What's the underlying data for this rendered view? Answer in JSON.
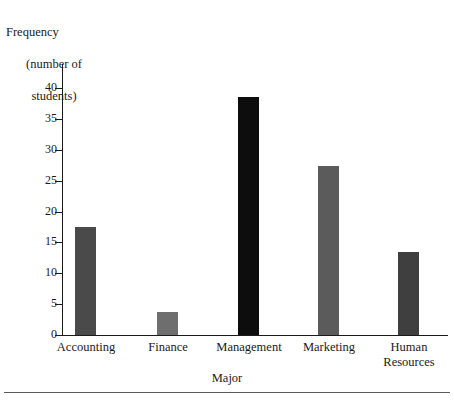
{
  "chart_data": {
    "type": "bar",
    "title": "",
    "xlabel": "Major",
    "ylabel": "Frequency (number of students)",
    "ylabel_lines": [
      "Frequency",
      "(number of",
      "students)"
    ],
    "categories": [
      "Accounting",
      "Finance",
      "Management",
      "Marketing",
      "Human Resources"
    ],
    "category_label_lines": [
      [
        "Accounting"
      ],
      [
        "Finance"
      ],
      [
        "Management"
      ],
      [
        "Marketing"
      ],
      [
        "Human",
        "Resources"
      ]
    ],
    "values": [
      17.5,
      3.8,
      38.5,
      27.3,
      13.5
    ],
    "bar_colors": [
      "#4a4a4a",
      "#6e6e6e",
      "#0d0d0d",
      "#5b5b5b",
      "#3f3f3f"
    ],
    "ylim": [
      0,
      40
    ],
    "yticks": [
      0,
      5,
      10,
      15,
      20,
      25,
      30,
      35,
      40
    ],
    "ytick_labels": [
      "0",
      "5",
      "10",
      "15",
      "20",
      "25",
      "30",
      "35",
      "40"
    ],
    "grid": false,
    "legend": null
  },
  "axis": {
    "y_tick_labels": [
      "40",
      "35",
      "30",
      "25",
      "20",
      "15",
      "10",
      "5",
      "0"
    ]
  }
}
